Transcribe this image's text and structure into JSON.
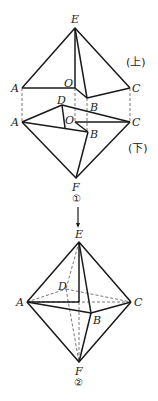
{
  "figure1": {
    "caption": "①",
    "upper_label": "(上)",
    "lower_label": "(下)",
    "upper_vertices": {
      "E": "E",
      "A": "A",
      "O": "O",
      "B": "B",
      "C": "C"
    },
    "lower_vertices": {
      "A": "A",
      "D": "D",
      "O": "O",
      "B": "B",
      "C": "C",
      "F": "F"
    }
  },
  "figure2": {
    "caption": "②",
    "vertices": {
      "E": "E",
      "A": "A",
      "D": "D",
      "B": "B",
      "C": "C",
      "F": "F"
    }
  }
}
